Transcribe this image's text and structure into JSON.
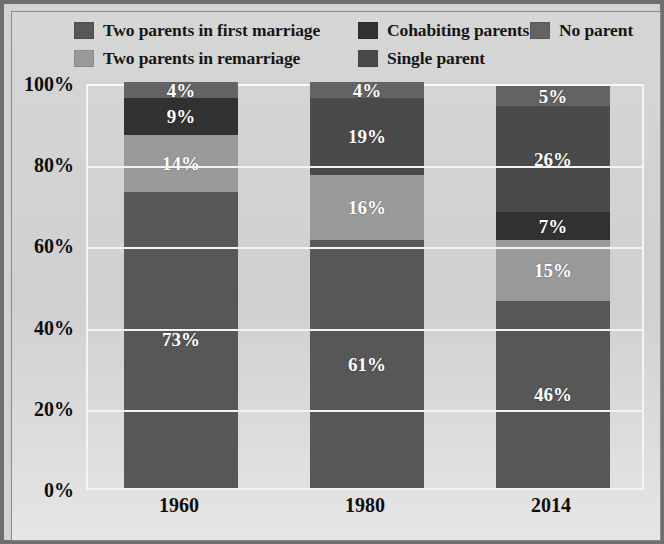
{
  "chart_data": {
    "type": "bar",
    "subtype": "stacked-bar-100pct",
    "title": "",
    "xlabel": "",
    "ylabel": "",
    "categories": [
      "1960",
      "1980",
      "2014"
    ],
    "ylim": [
      0,
      100
    ],
    "ytick_labels": [
      "0%",
      "20%",
      "40%",
      "60%",
      "80%",
      "100%"
    ],
    "ytick_values": [
      0,
      20,
      40,
      60,
      80,
      100
    ],
    "grid": true,
    "legend_position": "top",
    "stack_order_bottom_to_top": [
      "Two parents in first marriage",
      "Two parents in remarriage",
      "Cohabiting parents",
      "Single parent",
      "No parent"
    ],
    "series": [
      {
        "name": "Two parents in first marriage",
        "color": "#575757",
        "values": [
          73,
          61,
          46
        ],
        "labels": [
          "73%",
          "61%",
          "46%"
        ]
      },
      {
        "name": "Two parents in remarriage",
        "color": "#9a9a9a",
        "values": [
          14,
          16,
          15
        ],
        "labels": [
          "14%",
          "16%",
          "15%"
        ]
      },
      {
        "name": "Cohabiting parents",
        "color": "#313131",
        "values": [
          9,
          0,
          7
        ],
        "labels": [
          "9%",
          "",
          "7%"
        ]
      },
      {
        "name": "Single parent",
        "color": "#4a4a4a",
        "values": [
          0,
          19,
          26
        ],
        "labels": [
          "",
          "19%",
          "26%"
        ]
      },
      {
        "name": "No parent",
        "color": "#636363",
        "values": [
          4,
          4,
          5
        ],
        "labels": [
          "4%",
          "4%",
          "5%"
        ]
      }
    ]
  },
  "legend": {
    "rows": [
      [
        {
          "label": "Two parents in first marriage",
          "color": "#575757",
          "name": "legend-two-parents-first-marriage"
        },
        {
          "label": "Cohabiting parents",
          "color": "#313131",
          "name": "legend-cohabiting-parents"
        },
        {
          "label": "No parent",
          "color": "#636363",
          "name": "legend-no-parent"
        }
      ],
      [
        {
          "label": "Two parents in remarriage",
          "color": "#9a9a9a",
          "name": "legend-two-parents-remarriage"
        },
        {
          "label": "Single parent",
          "color": "#4a4a4a",
          "name": "legend-single-parent"
        }
      ]
    ]
  },
  "colors": {
    "frame_border": "#6f6f6f",
    "canvas_background": "#d2d2d2",
    "gridline": "#f4f4f4",
    "axis_text": "#0e0e0e",
    "segment_label_text": "#ffffff"
  }
}
